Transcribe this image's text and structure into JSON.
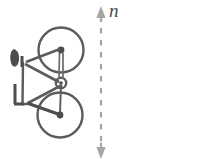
{
  "figure": {
    "name": "two-bicycles-rotation-axis-diagram",
    "type": "geometry-symmetry-diagram",
    "background_color": "#ffffff",
    "width": 198,
    "height": 164,
    "stroke_color": "#595959",
    "accent_color": "#4d4d4d"
  },
  "axis": {
    "label": "n",
    "label_style": "italic",
    "icon_name": "double-headed-dashed-arrow",
    "orientation": "vertical",
    "line_style": "dashed",
    "x": 101,
    "y_top": 8,
    "y_bottom": 158,
    "arrowheads": "both-ends",
    "color": "#999999"
  },
  "objects": [
    {
      "name": "bicycle-left",
      "facing": "left",
      "rotation_deg": 0,
      "center_x": 52,
      "center_y": 84,
      "parts": [
        "front-wheel",
        "rear-wheel",
        "frame",
        "handlebar",
        "saddle",
        "crank",
        "seat-tube",
        "fork"
      ]
    },
    {
      "name": "bicycle-right",
      "facing": "right",
      "rotation_deg": 180,
      "center_x": 150,
      "center_y": 84,
      "parts": [
        "front-wheel",
        "rear-wheel",
        "frame",
        "handlebar",
        "saddle",
        "crank",
        "seat-tube",
        "fork"
      ]
    }
  ],
  "wheels": {
    "left_bicycle": [
      {
        "name": "upper-wheel",
        "cx": 61,
        "cy": 50,
        "r": 23
      },
      {
        "name": "lower-wheel",
        "cx": 60,
        "cy": 115,
        "r": 23
      }
    ],
    "right_bicycle": [
      {
        "name": "upper-wheel",
        "cx": 139,
        "cy": 51,
        "r": 22
      },
      {
        "name": "lower-wheel",
        "cx": 140,
        "cy": 116,
        "r": 22
      }
    ]
  }
}
